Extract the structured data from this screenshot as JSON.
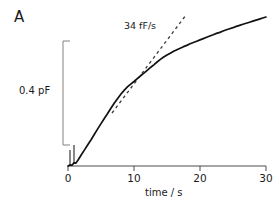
{
  "panel": {
    "label": "A"
  },
  "chart_data": {
    "type": "line",
    "title": "",
    "subtitle": "",
    "xlabel": "time / s",
    "ylabel": "",
    "xlim": [
      0,
      30
    ],
    "xticks": [
      0,
      10,
      20,
      30
    ],
    "xtick_labels": [
      "0",
      "10",
      "20",
      "30"
    ],
    "grid": false,
    "legend": false,
    "legend_position": "none",
    "y_scalebar": {
      "label": "0.4 pF",
      "value": 0.4,
      "units": "pF"
    },
    "annotations": [
      {
        "text": "34 fF/s",
        "kind": "slope-tangent",
        "value": 34,
        "units": "fF/s",
        "style": "dashed"
      }
    ],
    "series": [
      {
        "name": "membrane capacitance",
        "style": "solid",
        "x": [
          0.0,
          0.3,
          0.6,
          0.9,
          1.2,
          1.5,
          2.0,
          2.5,
          3.0,
          3.5,
          4.0,
          4.5,
          5.0,
          5.5,
          6.0,
          6.5,
          7.0,
          7.5,
          8.0,
          8.5,
          9.0,
          9.5,
          10.0,
          10.5,
          11.0,
          11.5,
          12.0,
          12.5,
          13.0,
          13.5,
          14.0,
          14.5,
          15.0,
          15.5,
          16.0,
          16.5,
          17.0,
          17.5,
          18.0,
          18.5,
          19.0,
          19.5,
          20.0,
          20.5,
          21.0,
          21.5,
          22.0,
          22.5,
          23.0,
          23.5,
          24.0,
          24.5,
          25.0,
          25.5,
          26.0,
          26.5,
          27.0,
          27.5,
          28.0,
          28.5,
          29.0,
          29.5,
          30.0
        ],
        "y": [
          0.0,
          0.004,
          0.003,
          0.012,
          0.011,
          0.022,
          0.042,
          0.062,
          0.082,
          0.101,
          0.122,
          0.143,
          0.163,
          0.183,
          0.202,
          0.222,
          0.241,
          0.259,
          0.276,
          0.291,
          0.304,
          0.315,
          0.325,
          0.336,
          0.347,
          0.357,
          0.368,
          0.379,
          0.389,
          0.4,
          0.41,
          0.419,
          0.427,
          0.434,
          0.441,
          0.447,
          0.453,
          0.459,
          0.464,
          0.47,
          0.475,
          0.48,
          0.485,
          0.49,
          0.495,
          0.5,
          0.505,
          0.51,
          0.514,
          0.519,
          0.524,
          0.528,
          0.532,
          0.537,
          0.541,
          0.545,
          0.549,
          0.553,
          0.557,
          0.561,
          0.565,
          0.569,
          0.573
        ]
      },
      {
        "name": "34 fF/s tangent",
        "style": "dashed",
        "x": [
          6.7,
          17.8
        ],
        "y": [
          0.205,
          0.583
        ]
      }
    ]
  }
}
